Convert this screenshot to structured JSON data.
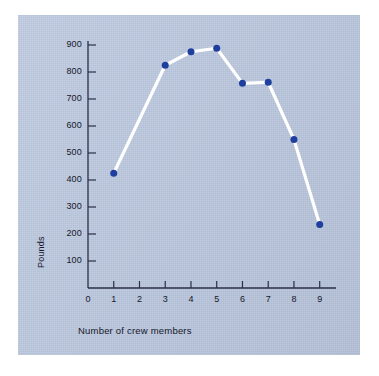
{
  "figure": {
    "background_color": "#b9c6de",
    "page_color": "#ffffff",
    "line_color": "#ffffff",
    "marker_color": "#1f3f9e",
    "axis_color": "#2a2f45",
    "text_color": "#15182b"
  },
  "chart_data": {
    "type": "line",
    "title": "",
    "xlabel": "Number of crew members",
    "ylabel": "Pounds",
    "x": [
      1,
      3,
      4,
      5,
      6,
      7,
      8,
      9
    ],
    "values": [
      425,
      825,
      875,
      888,
      758,
      762,
      550,
      235
    ],
    "xlim": [
      0,
      9.4
    ],
    "ylim": [
      0,
      950
    ],
    "xticks": [
      0,
      1,
      2,
      3,
      4,
      5,
      6,
      7,
      8,
      9
    ],
    "xticklabels": [
      "0",
      "1",
      "2",
      "3",
      "4",
      "5",
      "6",
      "7",
      "8",
      "9"
    ],
    "yticks": [
      100,
      200,
      300,
      400,
      500,
      600,
      700,
      800,
      900
    ],
    "yticklabels": [
      "100",
      "200",
      "300",
      "400",
      "500",
      "600",
      "700",
      "800",
      "900"
    ],
    "grid": false,
    "legend": null,
    "markers": "filled-circle",
    "marker_size": 7
  }
}
